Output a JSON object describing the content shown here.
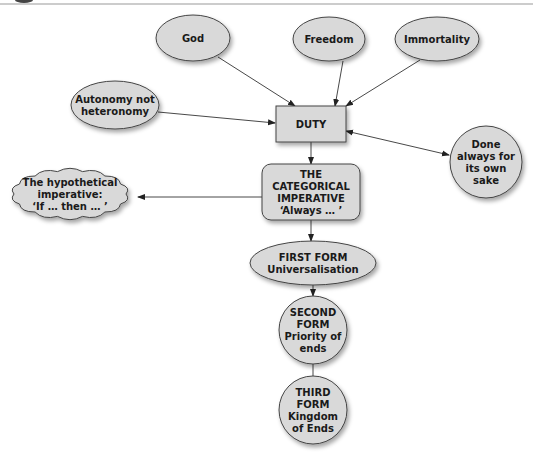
{
  "diagram": {
    "type": "concept-map",
    "nodes": {
      "god": {
        "shape": "ellipse",
        "lines": [
          "God"
        ]
      },
      "freedom": {
        "shape": "ellipse",
        "lines": [
          "Freedom"
        ]
      },
      "immortality": {
        "shape": "ellipse",
        "lines": [
          "Immortality"
        ]
      },
      "autonomy": {
        "shape": "ellipse",
        "lines": [
          "Autonomy not",
          "heteronomy"
        ]
      },
      "duty": {
        "shape": "rectangle",
        "lines": [
          "DUTY"
        ]
      },
      "done_always": {
        "shape": "circle",
        "lines": [
          "Done",
          "always for",
          "its own",
          "sake"
        ]
      },
      "hypothetical": {
        "shape": "cloud",
        "lines": [
          "The hypothetical",
          "imperative:",
          "‘If … then … ’"
        ]
      },
      "categorical": {
        "shape": "rounded-rectangle",
        "lines": [
          "THE",
          "CATEGORICAL",
          "IMPERATIVE",
          "‘Always … ’"
        ]
      },
      "first_form": {
        "shape": "ellipse",
        "lines": [
          "FIRST FORM",
          "Universalisation"
        ]
      },
      "second_form": {
        "shape": "circle",
        "lines": [
          "SECOND",
          "FORM",
          "Priority of",
          "ends"
        ]
      },
      "third_form": {
        "shape": "circle",
        "lines": [
          "THIRD",
          "FORM",
          "Kingdom",
          "of Ends"
        ]
      }
    },
    "edges": [
      {
        "from": "god",
        "to": "duty",
        "arrow": "end"
      },
      {
        "from": "freedom",
        "to": "duty",
        "arrow": "end"
      },
      {
        "from": "immortality",
        "to": "duty",
        "arrow": "end"
      },
      {
        "from": "autonomy",
        "to": "duty",
        "arrow": "end"
      },
      {
        "from": "duty",
        "to": "done_always",
        "arrow": "both"
      },
      {
        "from": "duty",
        "to": "categorical",
        "arrow": "end"
      },
      {
        "from": "categorical",
        "to": "hypothetical",
        "arrow": "end"
      },
      {
        "from": "categorical",
        "to": "first_form",
        "arrow": "end"
      },
      {
        "from": "first_form",
        "to": "second_form",
        "arrow": "end"
      },
      {
        "from": "second_form",
        "to": "third_form",
        "arrow": "none"
      }
    ],
    "colors": {
      "fill": "#d9d9d9",
      "stroke": "#444444",
      "text": "#1a1a1a",
      "rule": "#999999"
    }
  }
}
